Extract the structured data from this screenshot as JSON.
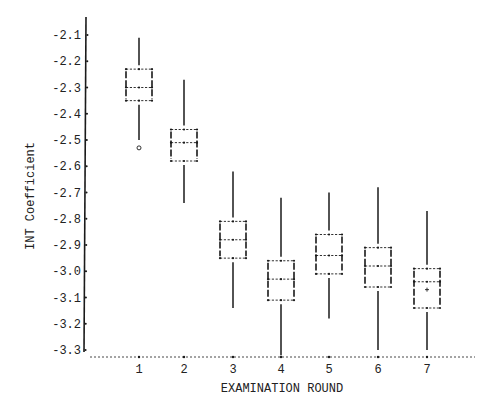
{
  "chart_data": {
    "type": "box",
    "title": "",
    "xlabel": "EXAMINATION ROUND",
    "ylabel": "INT Coefficient",
    "categories": [
      "1",
      "2",
      "3",
      "4",
      "5",
      "6",
      "7"
    ],
    "ylim": [
      -3.32,
      -2.05
    ],
    "yticks": [
      -2.1,
      -2.2,
      -2.3,
      -2.4,
      -2.5,
      -2.6,
      -2.7,
      -2.8,
      -2.9,
      -3.0,
      -3.1,
      -3.2,
      -3.3
    ],
    "ytick_labels": [
      "-2.1",
      "-2.2",
      "-2.3",
      "-2.4",
      "-2.5",
      "-2.6",
      "-2.7",
      "-2.8",
      "-2.9",
      "-3.0",
      "-3.1",
      "-3.2",
      "-3.3"
    ],
    "grid": false,
    "legend": null,
    "boxes": [
      {
        "round": "1",
        "whisker_high": -2.11,
        "q3": -2.23,
        "median": -2.3,
        "q1": -2.35,
        "whisker_low": -2.5,
        "outliers": [
          -2.53
        ],
        "mean": null
      },
      {
        "round": "2",
        "whisker_high": -2.27,
        "q3": -2.46,
        "median": -2.51,
        "q1": -2.58,
        "whisker_low": -2.74,
        "outliers": [],
        "mean": null
      },
      {
        "round": "3",
        "whisker_high": -2.62,
        "q3": -2.81,
        "median": -2.88,
        "q1": -2.95,
        "whisker_low": -3.14,
        "outliers": [],
        "mean": null
      },
      {
        "round": "4",
        "whisker_high": -2.72,
        "q3": -2.96,
        "median": -3.03,
        "q1": -3.11,
        "whisker_low": -3.32,
        "outliers": [],
        "mean": null
      },
      {
        "round": "5",
        "whisker_high": -2.7,
        "q3": -2.86,
        "median": -2.94,
        "q1": -3.01,
        "whisker_low": -3.18,
        "outliers": [],
        "mean": null
      },
      {
        "round": "6",
        "whisker_high": -2.68,
        "q3": -2.91,
        "median": -2.98,
        "q1": -3.06,
        "whisker_low": -3.3,
        "outliers": [],
        "mean": null
      },
      {
        "round": "7",
        "whisker_high": -2.77,
        "q3": -2.99,
        "median": -3.04,
        "q1": -3.14,
        "whisker_low": -3.3,
        "outliers": [],
        "mean": -3.07
      }
    ]
  },
  "colors": {
    "ink": "#1a1a1a",
    "background": "#ffffff"
  }
}
